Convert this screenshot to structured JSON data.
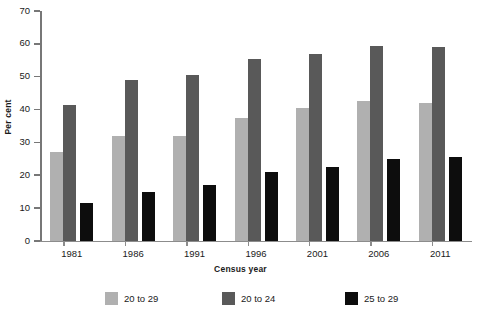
{
  "chart_data": {
    "type": "bar",
    "title": "",
    "xlabel": "Census year",
    "ylabel": "Per cent",
    "categories": [
      "1981",
      "1986",
      "1991",
      "1996",
      "2001",
      "2006",
      "2011"
    ],
    "series": [
      {
        "name": "20 to 29",
        "color": "#b0b0b0",
        "values": [
          27,
          32,
          32,
          37.5,
          40.5,
          42.5,
          42
        ]
      },
      {
        "name": "20 to 24",
        "color": "#595959",
        "values": [
          41.5,
          49,
          50.5,
          55.5,
          57,
          59.5,
          59
        ]
      },
      {
        "name": "25 to 29",
        "color": "#0d0d0d",
        "values": [
          11.5,
          15,
          17,
          21,
          22.5,
          25,
          25.5
        ]
      }
    ],
    "ylim": [
      0,
      70
    ],
    "yticks": [
      0,
      10,
      20,
      30,
      40,
      50,
      60,
      70
    ],
    "ytick_labels": [
      "0",
      "10",
      "20",
      "30",
      "40",
      "50",
      "60",
      "70"
    ],
    "grid": false,
    "legend_position": "bottom"
  }
}
